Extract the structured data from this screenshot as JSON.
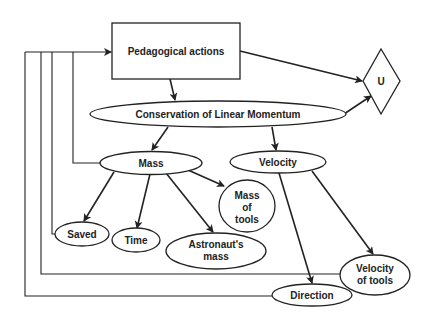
{
  "diagram": {
    "nodes": {
      "pedagogical": {
        "label": "Pedagogical actions",
        "shape": "rectangle"
      },
      "u": {
        "label": "U",
        "shape": "diamond"
      },
      "conservation": {
        "label": "Conservation of Linear Momentum",
        "shape": "ellipse"
      },
      "mass": {
        "label": "Mass",
        "shape": "ellipse"
      },
      "velocity": {
        "label": "Velocity",
        "shape": "ellipse"
      },
      "mass_of_tools": {
        "label_lines": [
          "Mass",
          "of",
          "tools"
        ],
        "shape": "ellipse"
      },
      "saved": {
        "label": "Saved",
        "shape": "ellipse"
      },
      "time": {
        "label": "Time",
        "shape": "ellipse"
      },
      "astronauts_mass": {
        "label_lines": [
          "Astronaut's",
          "mass"
        ],
        "shape": "ellipse"
      },
      "velocity_of_tools": {
        "label_lines": [
          "Velocity",
          "of tools"
        ],
        "shape": "ellipse"
      },
      "direction": {
        "label": "Direction",
        "shape": "ellipse"
      }
    },
    "edges": [
      {
        "from": "pedagogical",
        "to": "conservation"
      },
      {
        "from": "pedagogical",
        "to": "u"
      },
      {
        "from": "conservation",
        "to": "u"
      },
      {
        "from": "conservation",
        "to": "mass"
      },
      {
        "from": "conservation",
        "to": "velocity"
      },
      {
        "from": "mass",
        "to": "saved"
      },
      {
        "from": "mass",
        "to": "time"
      },
      {
        "from": "mass",
        "to": "astronauts_mass"
      },
      {
        "from": "mass",
        "to": "mass_of_tools"
      },
      {
        "from": "velocity",
        "to": "direction"
      },
      {
        "from": "velocity",
        "to": "velocity_of_tools"
      },
      {
        "from": "mass",
        "to": "pedagogical",
        "type": "feedback"
      },
      {
        "from": "saved",
        "to": "pedagogical",
        "type": "feedback"
      },
      {
        "from": "velocity_of_tools",
        "to": "pedagogical",
        "type": "feedback"
      },
      {
        "from": "direction",
        "to": "pedagogical",
        "type": "feedback"
      }
    ]
  }
}
